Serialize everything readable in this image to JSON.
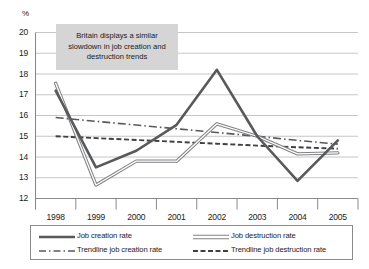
{
  "axis": {
    "y_unit_label": "%",
    "y_ticks": [
      "20",
      "19",
      "18",
      "17",
      "16",
      "15",
      "14",
      "13",
      "12"
    ],
    "x_ticks": [
      "1998",
      "1999",
      "2000",
      "2001",
      "2002",
      "2003",
      "2004",
      "2005"
    ]
  },
  "annotation": {
    "text": "Britain displays a similar slowdown in job creation and destruction trends"
  },
  "legend": {
    "items": [
      {
        "label": "Job creation rate",
        "style": "solid-dark"
      },
      {
        "label": "Job destruction rate",
        "style": "solid-hollow"
      },
      {
        "label": "Trendline job creation rate",
        "style": "dash-dot"
      },
      {
        "label": "Trendline job destruction rate",
        "style": "dashed"
      }
    ]
  },
  "colors": {
    "line_creation": "#58595b",
    "line_destruction": "#808285",
    "trend_creation": "#58595b",
    "trend_destruction": "#404040",
    "grid": "#bfbfbf",
    "axis": "#8a8a8a",
    "annotation_bg": "#d5d5d5",
    "text": "#1a1a1a"
  },
  "chart_data": {
    "type": "line",
    "title": "",
    "subtitle": "",
    "xlabel": "",
    "ylabel": "%",
    "x": [
      "1998",
      "1999",
      "2000",
      "2001",
      "2002",
      "2003",
      "2004",
      "2005"
    ],
    "ylim": [
      12,
      20
    ],
    "ytick_values": [
      12,
      13,
      14,
      15,
      16,
      17,
      18,
      19,
      20
    ],
    "grid": "horizontal",
    "legend_position": "bottom",
    "annotations": [
      {
        "text": "Britain displays a similar slowdown in job creation and destruction trends",
        "x_range": [
          "1998",
          "2000"
        ],
        "y_range": [
          18.6,
          20.0
        ]
      }
    ],
    "series": [
      {
        "name": "Job creation rate",
        "style": "solid",
        "values": [
          17.2,
          13.5,
          14.3,
          15.55,
          18.2,
          15.0,
          12.85,
          14.8
        ]
      },
      {
        "name": "Job destruction rate",
        "style": "solid",
        "values": [
          17.55,
          12.65,
          13.8,
          13.8,
          15.6,
          15.0,
          14.15,
          14.2
        ]
      },
      {
        "name": "Trendline job creation rate",
        "style": "dash-dot",
        "values": [
          15.9,
          15.72,
          15.54,
          15.36,
          15.18,
          15.0,
          14.8,
          14.62
        ]
      },
      {
        "name": "Trendline job destruction rate",
        "style": "dashed",
        "values": [
          15.0,
          14.91,
          14.82,
          14.73,
          14.64,
          14.55,
          14.47,
          14.4
        ]
      }
    ]
  }
}
